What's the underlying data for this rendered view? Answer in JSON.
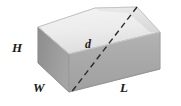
{
  "figure": {
    "name": "rectangular-box-diagonal-diagram",
    "background_color": "#ffffff",
    "projection": "oblique",
    "labels": [
      {
        "id": "height",
        "text": "H",
        "meaning": "height of the box",
        "x": 12,
        "y": 41
      },
      {
        "id": "width",
        "text": "W",
        "meaning": "width of the box",
        "x": 33,
        "y": 81
      },
      {
        "id": "diagonal",
        "text": "d",
        "meaning": "space diagonal of the box",
        "x": 85,
        "y": 38
      },
      {
        "id": "length",
        "text": "L",
        "meaning": "length of the box",
        "x": 120,
        "y": 81
      }
    ],
    "colors": {
      "top_face": "#ececec",
      "top_face_shade": "#e2e2e2",
      "front_face": "#a9a9a9",
      "front_face_shade": "#b4b4b4",
      "left_face": "#9b9b9b",
      "left_face_shade": "#8f8f8f",
      "edge": "#8a8a8a",
      "diagonal_line": "#2b2b2b",
      "label_color": "#1a1a1a"
    },
    "vertices": {
      "top_back_left": {
        "x": 95,
        "y": 8
      },
      "top_back_right": {
        "x": 137,
        "y": 7
      },
      "top_front_right": {
        "x": 160,
        "y": 32
      },
      "top_front_left": {
        "x": 69,
        "y": 54
      },
      "top_left": {
        "x": 38,
        "y": 27
      },
      "bottom_front_left": {
        "x": 69,
        "y": 92
      },
      "bottom_front_right": {
        "x": 160,
        "y": 69
      },
      "bottom_left": {
        "x": 38,
        "y": 63
      }
    },
    "diagonal": {
      "style": "dashed",
      "from": {
        "x": 137,
        "y": 7
      },
      "to": {
        "x": 70,
        "y": 94
      },
      "dash_pattern": "6 4",
      "stroke_width": 1.4
    }
  }
}
